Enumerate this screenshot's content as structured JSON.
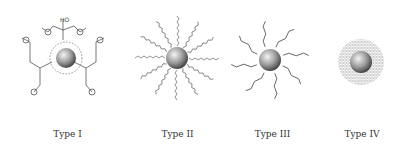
{
  "figure": {
    "panels": [
      {
        "id": "type-1",
        "label": "Type I",
        "description": "Nanoparticle capped with citrate ligands",
        "ligand_labels": {
          "hydroxyl": "HO",
          "hydroxyl_alt": "OH",
          "charge": "⊖"
        }
      },
      {
        "id": "type-2",
        "label": "Type II",
        "description": "Nanoparticle with zigzag alkyl chain ligands"
      },
      {
        "id": "type-3",
        "label": "Type III",
        "description": "Nanoparticle with thiol-linked carboxylic acid ligands",
        "ligand_labels": {
          "sulfur": "S",
          "acid": "OH",
          "acid_alt": "HO",
          "oxygen": "O"
        }
      },
      {
        "id": "type-4",
        "label": "Type IV",
        "description": "Nanoparticle in mesh/polymer shell"
      }
    ],
    "colors": {
      "line": "#555555",
      "particle_dark": "#444444",
      "particle_light": "#f2f2f2",
      "mesh": "#9a9a9a"
    }
  }
}
